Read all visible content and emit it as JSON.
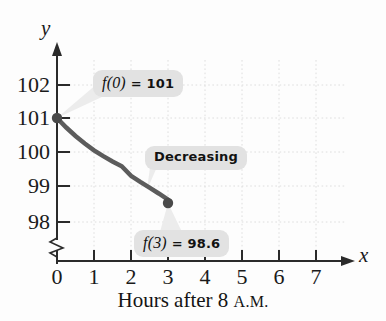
{
  "figure": {
    "background_color": "#fdfdfd",
    "caption": {
      "prefix": "Hours after 8 ",
      "smallcaps": "A.M."
    }
  },
  "axes": {
    "y_axis_name": "y",
    "x_axis_name": "x",
    "y_axis_has_break": true
  },
  "chart_data": {
    "type": "line",
    "title": "",
    "subtitle": "",
    "xlabel": "Hours after 8 A.M.",
    "ylabel": "y",
    "xlim": [
      0,
      7.6
    ],
    "ylim": [
      97.6,
      102.4
    ],
    "grid": true,
    "legend_position": "none",
    "x_ticks": [
      0,
      1,
      2,
      3,
      4,
      5,
      6,
      7
    ],
    "x_tick_labels": [
      "0",
      "1",
      "2",
      "3",
      "4",
      "5",
      "6",
      "7"
    ],
    "y_ticks": [
      98,
      99,
      100,
      101,
      102
    ],
    "y_tick_labels": [
      "98",
      "99",
      "100",
      "101",
      "102"
    ],
    "series": [
      {
        "name": "f",
        "color": "#5c5c5c",
        "line_width": 4,
        "x": [
          0.0,
          0.25,
          0.5,
          0.75,
          1.0,
          1.25,
          1.5,
          1.75,
          2.0,
          2.25,
          2.5,
          2.75,
          3.0
        ],
        "y": [
          101.0,
          100.72,
          100.47,
          100.25,
          100.05,
          99.88,
          99.72,
          99.58,
          99.3,
          99.12,
          98.95,
          98.78,
          98.6
        ],
        "marker_points": [
          {
            "x": 0,
            "y": 101,
            "label": "f(0) = 101"
          },
          {
            "x": 3,
            "y": 98.6,
            "label": "f(3) = 98.6"
          }
        ]
      }
    ],
    "annotations": [
      {
        "id": "f0",
        "fn_text": "f(0)",
        "rest_text": " = 101",
        "full_text": "f(0) = 101",
        "points_to": {
          "x": 0,
          "y": 101
        }
      },
      {
        "id": "decreasing",
        "fn_text": "",
        "rest_text": "Decreasing",
        "full_text": "Decreasing",
        "points_to": {
          "x": 1.45,
          "y": 99.55
        }
      },
      {
        "id": "f3",
        "fn_text": "f(3)",
        "rest_text": " = 98.6",
        "full_text": "f(3) = 98.6",
        "points_to": {
          "x": 3,
          "y": 98.6
        }
      }
    ],
    "colors": {
      "curve": "#5c5c5c",
      "axis": "#2b2b2b",
      "grid": "#dcdcdc",
      "callout_bg": "#e2e2e2",
      "callout_text": "#121212",
      "leader": "#eaeaea"
    }
  }
}
